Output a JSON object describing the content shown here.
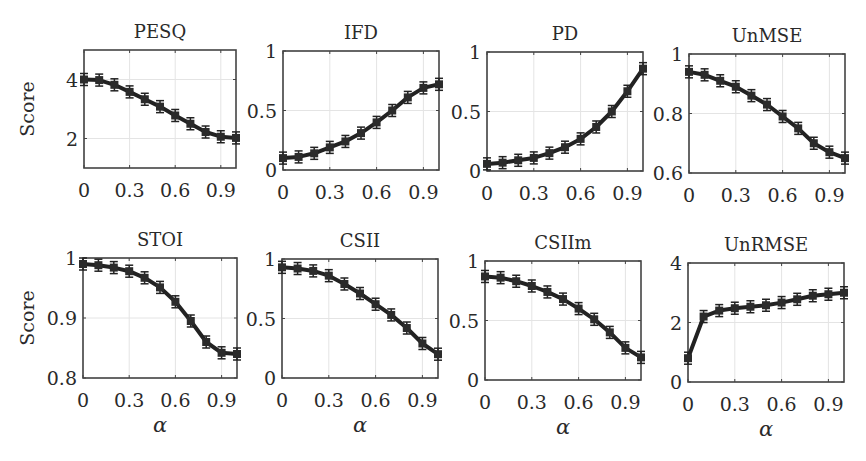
{
  "figure": {
    "ylabel": "Score",
    "xlabel": "α",
    "colors": {
      "line": "#222222",
      "marker": "#2b2b2b",
      "axes": "#444444",
      "grid": "#e4e4e4",
      "text": "#2a2a2a",
      "background": "#ffffff"
    }
  },
  "chart_data": [
    {
      "type": "line",
      "title": "PESQ",
      "xlabel": "",
      "ylabel": "Score",
      "x": [
        0,
        0.1,
        0.2,
        0.3,
        0.4,
        0.5,
        0.6,
        0.7,
        0.8,
        0.9,
        1.0
      ],
      "values": [
        4.0,
        3.98,
        3.82,
        3.58,
        3.33,
        3.08,
        2.78,
        2.5,
        2.22,
        2.06,
        2.02
      ],
      "xlim": [
        0,
        1
      ],
      "ylim": [
        1,
        5
      ],
      "xticks": [
        "0",
        "0.3",
        "0.6",
        "0.9"
      ],
      "yticks": [
        "2",
        "4"
      ],
      "grid": true,
      "box": [
        84,
        50,
        236,
        168
      ]
    },
    {
      "type": "line",
      "title": "IFD",
      "xlabel": "",
      "ylabel": "",
      "x": [
        0,
        0.1,
        0.2,
        0.3,
        0.4,
        0.5,
        0.6,
        0.7,
        0.8,
        0.9,
        1.0
      ],
      "values": [
        0.1,
        0.11,
        0.14,
        0.19,
        0.24,
        0.31,
        0.4,
        0.5,
        0.61,
        0.69,
        0.72
      ],
      "xlim": [
        0,
        1
      ],
      "ylim": [
        0,
        1
      ],
      "xticks": [
        "0",
        "0.3",
        "0.6",
        "0.9"
      ],
      "yticks": [
        "0",
        "0.5",
        "1"
      ],
      "grid": true,
      "box": [
        283,
        51,
        439,
        170
      ]
    },
    {
      "type": "line",
      "title": "PD",
      "xlabel": "",
      "ylabel": "",
      "x": [
        0,
        0.1,
        0.2,
        0.3,
        0.4,
        0.5,
        0.6,
        0.7,
        0.8,
        0.9,
        1.0
      ],
      "values": [
        0.06,
        0.07,
        0.09,
        0.11,
        0.15,
        0.2,
        0.27,
        0.37,
        0.5,
        0.67,
        0.86
      ],
      "xlim": [
        0,
        1
      ],
      "ylim": [
        0,
        1
      ],
      "xticks": [
        "0",
        "0.3",
        "0.6",
        "0.9"
      ],
      "yticks": [
        "0",
        "0.5",
        "1"
      ],
      "grid": true,
      "box": [
        487,
        52,
        643,
        171
      ]
    },
    {
      "type": "line",
      "title": "UnMSE",
      "xlabel": "",
      "ylabel": "",
      "x": [
        0,
        0.1,
        0.2,
        0.3,
        0.4,
        0.5,
        0.6,
        0.7,
        0.8,
        0.9,
        1.0
      ],
      "values": [
        0.94,
        0.93,
        0.91,
        0.89,
        0.86,
        0.83,
        0.79,
        0.75,
        0.7,
        0.67,
        0.65
      ],
      "xlim": [
        0,
        1
      ],
      "ylim": [
        0.6,
        1
      ],
      "xticks": [
        "0",
        "0.3",
        "0.6",
        "0.9"
      ],
      "yticks": [
        "0.6",
        "0.8",
        "1"
      ],
      "grid": true,
      "box": [
        689,
        54,
        845,
        173
      ]
    },
    {
      "type": "line",
      "title": "STOI",
      "xlabel": "α",
      "ylabel": "Score",
      "x": [
        0,
        0.1,
        0.2,
        0.3,
        0.4,
        0.5,
        0.6,
        0.7,
        0.8,
        0.9,
        1.0
      ],
      "values": [
        0.99,
        0.988,
        0.984,
        0.978,
        0.967,
        0.951,
        0.927,
        0.895,
        0.86,
        0.842,
        0.84
      ],
      "xlim": [
        0,
        1
      ],
      "ylim": [
        0.8,
        1
      ],
      "xticks": [
        "0",
        "0.3",
        "0.6",
        "0.9"
      ],
      "yticks": [
        "0.8",
        "0.9",
        "1"
      ],
      "grid": true,
      "box": [
        83,
        258,
        237,
        378
      ]
    },
    {
      "type": "line",
      "title": "CSII",
      "xlabel": "α",
      "ylabel": "",
      "x": [
        0,
        0.1,
        0.2,
        0.3,
        0.4,
        0.5,
        0.6,
        0.7,
        0.8,
        0.9,
        1.0
      ],
      "values": [
        0.93,
        0.92,
        0.9,
        0.86,
        0.79,
        0.71,
        0.62,
        0.53,
        0.42,
        0.29,
        0.2
      ],
      "xlim": [
        0,
        1
      ],
      "ylim": [
        0,
        1
      ],
      "xticks": [
        "0",
        "0.3",
        "0.6",
        "0.9"
      ],
      "yticks": [
        "0",
        "0.5",
        "1"
      ],
      "grid": true,
      "box": [
        282,
        259,
        438,
        378
      ]
    },
    {
      "type": "line",
      "title": "CSIIm",
      "xlabel": "α",
      "ylabel": "",
      "x": [
        0,
        0.1,
        0.2,
        0.3,
        0.4,
        0.5,
        0.6,
        0.7,
        0.8,
        0.9,
        1.0
      ],
      "values": [
        0.87,
        0.86,
        0.83,
        0.79,
        0.74,
        0.68,
        0.6,
        0.51,
        0.4,
        0.27,
        0.19
      ],
      "xlim": [
        0,
        1
      ],
      "ylim": [
        0,
        1
      ],
      "xticks": [
        "0",
        "0.3",
        "0.6",
        "0.9"
      ],
      "yticks": [
        "0",
        "0.5",
        "1"
      ],
      "grid": true,
      "box": [
        485,
        261,
        641,
        380
      ]
    },
    {
      "type": "line",
      "title": "UnRMSE",
      "xlabel": "α",
      "ylabel": "",
      "x": [
        0,
        0.1,
        0.2,
        0.3,
        0.4,
        0.5,
        0.6,
        0.7,
        0.8,
        0.9,
        1.0
      ],
      "values": [
        0.8,
        2.2,
        2.4,
        2.48,
        2.53,
        2.58,
        2.67,
        2.78,
        2.9,
        2.95,
        3.0
      ],
      "xlim": [
        0,
        1
      ],
      "ylim": [
        0,
        4
      ],
      "xticks": [
        "0",
        "0.3",
        "0.6",
        "0.9"
      ],
      "yticks": [
        "0",
        "2",
        "4"
      ],
      "grid": true,
      "box": [
        688,
        263,
        844,
        382
      ]
    }
  ]
}
